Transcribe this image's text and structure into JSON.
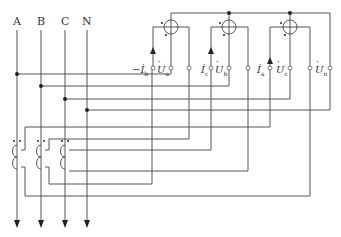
{
  "diagram": {
    "type": "three-phase four-wire energy metering circuit with current transformers",
    "colors": {
      "wire": "#555555",
      "background": "#ffffff"
    },
    "phase_lines": [
      {
        "label": "A",
        "x": 17
      },
      {
        "label": "B",
        "x": 41
      },
      {
        "label": "C",
        "x": 65
      },
      {
        "label": "N",
        "x": 87
      }
    ],
    "meter_elements": [
      {
        "id": "element-1",
        "cx": 171,
        "cy": 27,
        "current_label": "−İ",
        "current_sub": "b",
        "voltage_label": "U",
        "voltage_sub": "a"
      },
      {
        "id": "element-2",
        "cx": 229,
        "cy": 27,
        "current_label": "İ",
        "current_sub": "c",
        "voltage_label": "U",
        "voltage_sub": "b"
      },
      {
        "id": "element-3",
        "cx": 290,
        "cy": 27,
        "current_label": "İ",
        "current_sub": "a",
        "voltage_label": "U",
        "voltage_sub": "c"
      }
    ],
    "neutral_terminal": {
      "label": "U",
      "sub": "n",
      "x": 330
    },
    "current_transformers": [
      {
        "id": "ct-a",
        "phase": "A",
        "x": 17
      },
      {
        "id": "ct-b",
        "phase": "B",
        "x": 41
      },
      {
        "id": "ct-c",
        "phase": "C",
        "x": 65
      }
    ]
  }
}
